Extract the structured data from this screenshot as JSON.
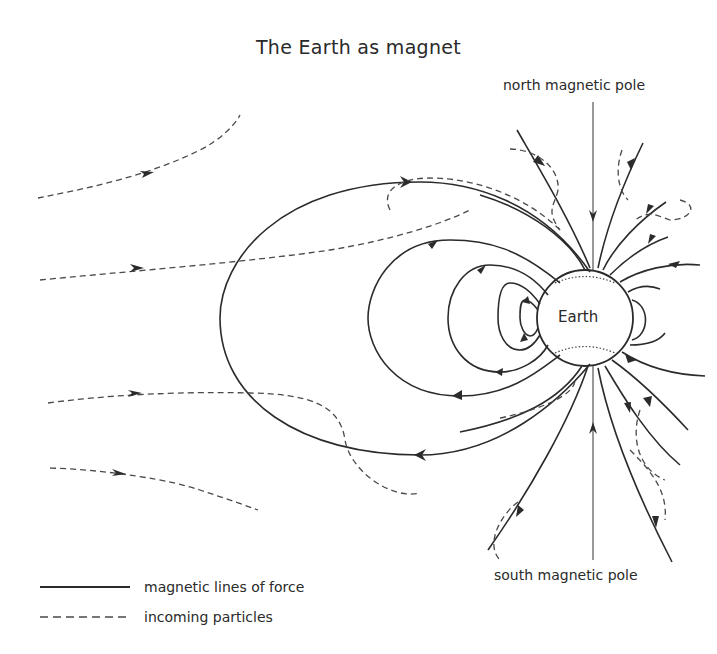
{
  "title": "The Earth as magnet",
  "labels": {
    "north_pole": "north magnetic pole",
    "south_pole": "south magnetic pole",
    "earth": "Earth"
  },
  "legend": {
    "items": [
      {
        "style": "solid",
        "label": "magnetic lines of force"
      },
      {
        "style": "dashed",
        "label": "incoming particles"
      }
    ]
  },
  "colors": {
    "line": "#2b2b2b",
    "background": "#ffffff"
  }
}
